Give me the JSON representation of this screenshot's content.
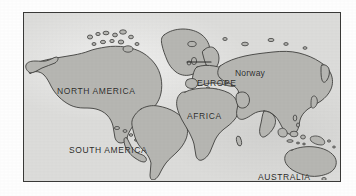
{
  "image": {
    "kind": "world-map",
    "style": "hand-drawn scanned map",
    "ocean_color": "#dcdcda",
    "land_color": "#b6b6b2",
    "outline_color": "#3f3f3d",
    "frame_color": "#3a3a38",
    "label_color": "#2b2b29",
    "page_background": "#ffffff"
  },
  "map": {
    "labels": {
      "north_america": "NORTH AMERICA",
      "south_america": "SOUTH AMERICA",
      "europe": "EUROPE",
      "africa": "AFRICA",
      "australia": "AUSTRALIA",
      "norway": "Norway"
    },
    "annotation": {
      "callout_label": "Norway",
      "callout_target": "Scandinavian peninsula"
    },
    "landmasses": [
      "North America",
      "Greenland",
      "South America",
      "Europe",
      "Africa",
      "Asia",
      "Australia",
      "New Zealand",
      "Indonesian archipelago",
      "Arctic islands",
      "Caribbean islands",
      "Japan",
      "Madagascar",
      "British Isles",
      "Iceland"
    ]
  }
}
